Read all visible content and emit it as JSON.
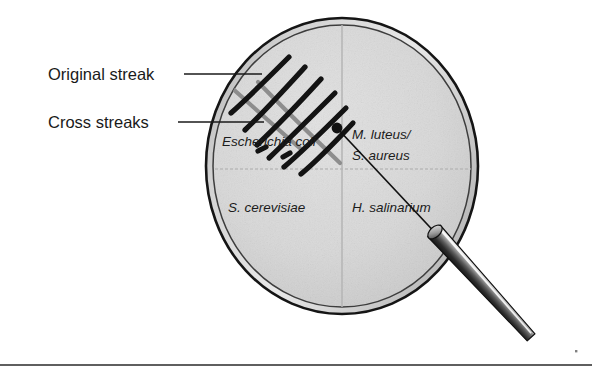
{
  "figure": {
    "background_color": "#ffffff"
  },
  "callouts": [
    {
      "id": "original-streak",
      "label": "Original streak",
      "text_x": 48,
      "text_y": 80,
      "leader_x1": 184,
      "leader_y1": 74,
      "leader_x2": 262,
      "leader_y2": 74
    },
    {
      "id": "cross-streaks",
      "label": "Cross streaks",
      "text_x": 48,
      "text_y": 128,
      "leader_x1": 178,
      "leader_y1": 122,
      "leader_x2": 264,
      "leader_y2": 122
    }
  ],
  "dish": {
    "center_x": 342,
    "center_y": 166,
    "radius_x": 137,
    "radius_y": 149,
    "rim_color": "#1a1a1a",
    "rim_band_color": "#bdbdbd",
    "agar_color": "#d9d9d9",
    "divider_color": "#b4b4b4"
  },
  "quadrants": [
    {
      "id": "quadrant-upper-left",
      "lines": [
        "Escherichia coli"
      ],
      "x": 222,
      "y": 146
    },
    {
      "id": "quadrant-upper-right",
      "lines": [
        "M. luteus/",
        "S. aureus"
      ],
      "x": 352,
      "y": 139
    },
    {
      "id": "quadrant-lower-left",
      "lines": [
        "S. cerevisiae"
      ],
      "x": 228,
      "y": 212
    },
    {
      "id": "quadrant-lower-right",
      "lines": [
        "H. salinarium"
      ],
      "x": 352,
      "y": 212
    }
  ],
  "streaks": {
    "original_color": "#8d8d8d",
    "cross_color": "#131313",
    "original_paths": [
      "M 213 71 L 302 150",
      "M 258 82 L 340 163"
    ],
    "cross_paths": [
      "M 229 112 L 287 58",
      "M 244 128 L 303 68",
      "M 255 143 L 320 79",
      "M 267 156 L 334 93",
      "M 282 166 L 345 108",
      "M 299 173 L 352 123"
    ]
  },
  "loop": {
    "tip_x": 337,
    "tip_y": 128,
    "tip_radius": 5.4,
    "wire_path": "M 337 128 L 440 238",
    "handle_from_x": 434,
    "handle_from_y": 231,
    "handle_to_x": 531,
    "handle_to_y": 339,
    "handle_light": "#f2f2f2",
    "handle_mid": "#6d6d6d",
    "handle_dark": "#1c1c1c"
  },
  "footer": {
    "rule_y": 365,
    "rule_x1": 0,
    "rule_x2": 592,
    "rule_color": "#2a2a2a",
    "speck_x": 575,
    "speck_y": 350
  }
}
